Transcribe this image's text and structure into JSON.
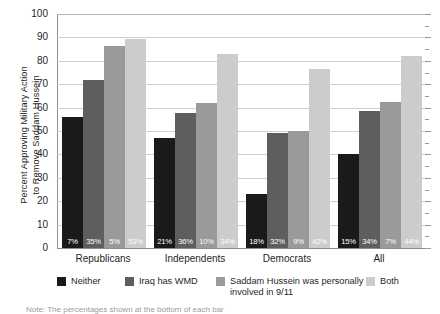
{
  "chart_data": {
    "type": "bar",
    "title": "",
    "xlabel": "",
    "ylabel": "Percent Approving Military Action to Remove Saddam Hussein",
    "ylabel_lines": [
      "Percent Approving Military Action",
      "to Remove Saddam Hussein"
    ],
    "ylim": [
      0,
      100
    ],
    "ytick_labels": [
      "0",
      "10",
      "20",
      "30",
      "40",
      "50",
      "60",
      "70",
      "80",
      "90",
      "100"
    ],
    "ytick_values": [
      0,
      10,
      20,
      30,
      40,
      50,
      60,
      70,
      80,
      90,
      100
    ],
    "grid": true,
    "legend_position": "bottom",
    "categories": [
      "Republicans",
      "Independents",
      "Democrats",
      "All"
    ],
    "series": [
      {
        "name": "Neither",
        "color": "#1a1a1a",
        "values": [
          56,
          47,
          23,
          40
        ],
        "data_labels": [
          "7%",
          "21%",
          "18%",
          "15%"
        ]
      },
      {
        "name": "Iraq has WMD",
        "color": "#5e5e5e",
        "values": [
          72,
          57.5,
          49,
          58.5
        ],
        "data_labels": [
          "35%",
          "36%",
          "32%",
          "34%"
        ]
      },
      {
        "name": "Saddam Hussein was personally\ninvolved in 9/11",
        "color": "#9a9a9a",
        "values": [
          86.5,
          62,
          50,
          62.5
        ],
        "data_labels": [
          "5%",
          "10%",
          "9%",
          "7%"
        ]
      },
      {
        "name": "Both",
        "color": "#cccccc",
        "values": [
          89.5,
          83,
          76.5,
          82
        ],
        "data_labels": [
          "53%",
          "34%",
          "42%",
          "44%"
        ]
      }
    ]
  },
  "legend": {
    "items": [
      {
        "label": "Neither",
        "color": "#1a1a1a",
        "left": 57
      },
      {
        "label": "Iraq has WMD",
        "color": "#5e5e5e",
        "left": 125
      },
      {
        "label": "Saddam Hussein was personally\ninvolved in 9/11",
        "color": "#9a9a9a",
        "left": 216
      },
      {
        "label": "Both",
        "color": "#cccccc",
        "left": 366
      }
    ]
  },
  "note": "Note: The percentages shown at the bottom of each bar"
}
